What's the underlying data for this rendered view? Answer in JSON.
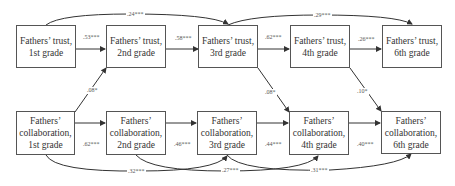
{
  "nodes": {
    "trust_1": {
      "label": "Fathers’ trust,\n1st grade"
    },
    "trust_2": {
      "label": "Fathers’ trust,\n2nd grade"
    },
    "trust_3": {
      "label": "Fathers’ trust,\n3rd grade"
    },
    "trust_4": {
      "label": "Fathers’ trust,\n4th grade"
    },
    "trust_6": {
      "label": "Fathers’ trust,\n6th grade"
    },
    "collab_1": {
      "label": "Fathers’\ncollaboration,\n1st grade"
    },
    "collab_2": {
      "label": "Fathers’\ncollaboration,\n2nd grade"
    },
    "collab_3": {
      "label": "Fathers’\ncollaboration,\n3rd grade"
    },
    "collab_4": {
      "label": "Fathers’\ncollaboration,\n4th grade"
    },
    "collab_6": {
      "label": "Fathers’\ncollaboration,\n6th grade"
    }
  },
  "edges": {
    "t1_t2": ".53***",
    "t2_t3": ".58***",
    "t3_t4": ".62***",
    "t4_t6": ".26***",
    "t1_t3": ".24***",
    "t3_t6": ".29***",
    "c1_t2": ".08*",
    "t3_c4": ".08*",
    "t4_c6": ".10*",
    "c1_c2": ".62***",
    "c2_c3": ".46***",
    "c3_c4": ".44***",
    "c4_c6": ".40***",
    "c1_c3": ".32***",
    "c2_c4": ".27***",
    "c3_c6": ".31***"
  }
}
